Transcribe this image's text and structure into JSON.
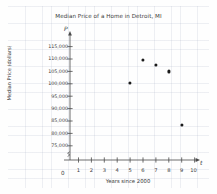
{
  "chart_data": {
    "type": "scatter",
    "title": "Median Price of a Home in Detroit, MI",
    "xlabel": "Years since 2000",
    "ylabel": "Median Price (dollars)",
    "x_axis_variable": "t",
    "y_axis_variable": "P",
    "origin_label": "0",
    "grid": true,
    "legend": "none",
    "xlim": [
      0,
      10.6
    ],
    "ylim": [
      73000,
      117500
    ],
    "x_ticks": [
      1,
      2,
      3,
      4,
      5,
      6,
      7,
      8,
      9,
      10
    ],
    "x_tick_labels": [
      "1",
      "2",
      "3",
      "4",
      "5",
      "6",
      "7",
      "8",
      "9",
      "10"
    ],
    "y_ticks": [
      75000,
      80000,
      85000,
      90000,
      95000,
      100000,
      105000,
      110000,
      115000
    ],
    "y_tick_labels": [
      "75,000",
      "80,000",
      "85,000",
      "90,000",
      "95,000",
      "100,000",
      "105,000",
      "110,000",
      "115,000"
    ],
    "x": [
      5,
      6,
      7,
      8,
      9
    ],
    "values": [
      100500,
      109500,
      107500,
      105000,
      83500
    ],
    "points": [
      {
        "x": 5,
        "y": 100500
      },
      {
        "x": 6,
        "y": 109500
      },
      {
        "x": 7,
        "y": 107500
      },
      {
        "x": 8,
        "y": 105000
      },
      {
        "x": 9,
        "y": 83500
      }
    ],
    "marker_color": "#1b1b1b",
    "axis_color": "#4a4a4a",
    "grid_color": "#c9cfe0"
  }
}
